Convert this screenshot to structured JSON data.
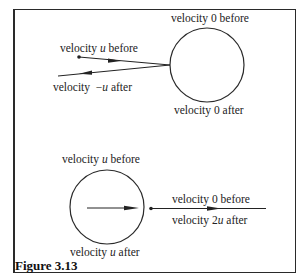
{
  "figure": {
    "caption": "Figure 3.13",
    "top_scenario": {
      "large_ball_before": "velocity 0 before",
      "large_ball_after": "velocity 0 after",
      "small_ball_before_prefix": "velocity ",
      "small_ball_before_var": "u",
      "small_ball_before_suffix": " before",
      "small_ball_after_prefix": "velocity  −",
      "small_ball_after_var": "u",
      "small_ball_after_suffix": " after"
    },
    "bottom_scenario": {
      "large_ball_before_prefix": "velocity ",
      "large_ball_before_var": "u",
      "large_ball_before_suffix": " before",
      "large_ball_after_prefix": "velocity ",
      "large_ball_after_var": "u",
      "large_ball_after_suffix": " after",
      "small_ball_before": "velocity 0 before",
      "small_ball_after_prefix": "velocity 2",
      "small_ball_after_var": "u",
      "small_ball_after_suffix": " after"
    },
    "colors": {
      "ink": "#222222",
      "background": "#ffffff"
    }
  }
}
